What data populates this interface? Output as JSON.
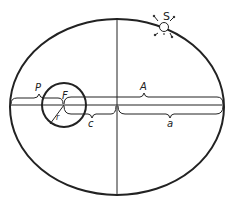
{
  "diagram": {
    "type": "orbit-ellipse",
    "labels": {
      "satellite": "S",
      "focus": "F",
      "perigee": "P",
      "apogee": "A",
      "radius": "r",
      "focal_distance": "c",
      "semi_major_axis": "a"
    },
    "colors": {
      "stroke": "#222222",
      "background": "#ffffff"
    }
  }
}
